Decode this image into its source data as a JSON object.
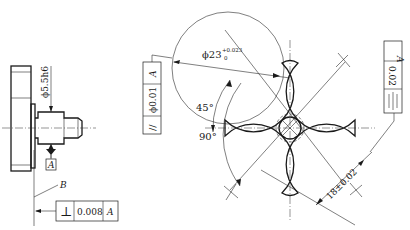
{
  "left_view": {
    "diameter_dim": "ϕ5.5h6",
    "datum_label": "A",
    "surface_label": "B",
    "tolerance_frame": {
      "symbol": "⊥",
      "symbol_name": "perpendicularity",
      "value": "0.008",
      "datum": "A"
    }
  },
  "right_view": {
    "circle_dim_main": "ϕ23",
    "circle_dim_upper": "+0.023",
    "circle_dim_lower": "0",
    "angle_45": "45°",
    "angle_90": "90°",
    "linear_dim": "18±0.02",
    "left_tolerance_frame": {
      "symbol": "//",
      "symbol_name": "parallelism",
      "value": "ϕ0.01",
      "datum": "A"
    },
    "right_tolerance_frame": {
      "symbol": "≡",
      "symbol_name": "symmetry",
      "value": "0.02",
      "datum": "A"
    }
  }
}
